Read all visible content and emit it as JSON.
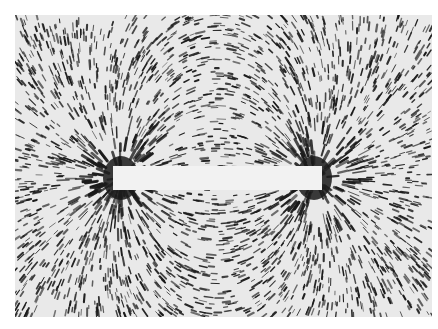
{
  "image": {
    "subject": "iron filings around a bar magnet",
    "colors": {
      "background": "#ffffff",
      "paper": "#e9e9e9",
      "filings": "#1a1a1a",
      "magnet": "#f2f2f2"
    },
    "magnet": {
      "x": 113,
      "y": 166,
      "width": 209,
      "height": 24
    }
  }
}
